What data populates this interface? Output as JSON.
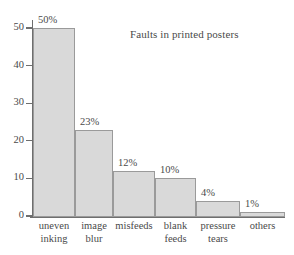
{
  "chart_data": {
    "type": "bar",
    "title": "Faults in printed posters",
    "xlabel": "",
    "ylabel": "",
    "ylim": [
      0,
      50
    ],
    "grid": false,
    "legend": "none",
    "yticks": [
      0,
      10,
      20,
      30,
      40,
      50
    ],
    "ytick_labels": [
      "0",
      "10",
      "20",
      "30",
      "40",
      "50"
    ],
    "categories": [
      "uneven inking",
      "image blur",
      "misfeeds",
      "blank feeds",
      "pressure tears",
      "others"
    ],
    "category_lines": [
      [
        "uneven",
        "inking"
      ],
      [
        "image",
        "blur"
      ],
      [
        "misfeeds",
        ""
      ],
      [
        "blank",
        "feeds"
      ],
      [
        "pressure",
        "tears"
      ],
      [
        "others",
        ""
      ]
    ],
    "values": [
      50,
      23,
      12,
      10,
      4,
      1
    ],
    "value_labels": [
      "50%",
      "23%",
      "12%",
      "10%",
      "4%",
      "1%"
    ],
    "bar_fill_color": "#d9d9d9",
    "bar_border_color": "#9a9a9a",
    "axis_color": "#6e6e6e",
    "text_color": "#4a4a4a",
    "background_color": "#ffffff"
  }
}
